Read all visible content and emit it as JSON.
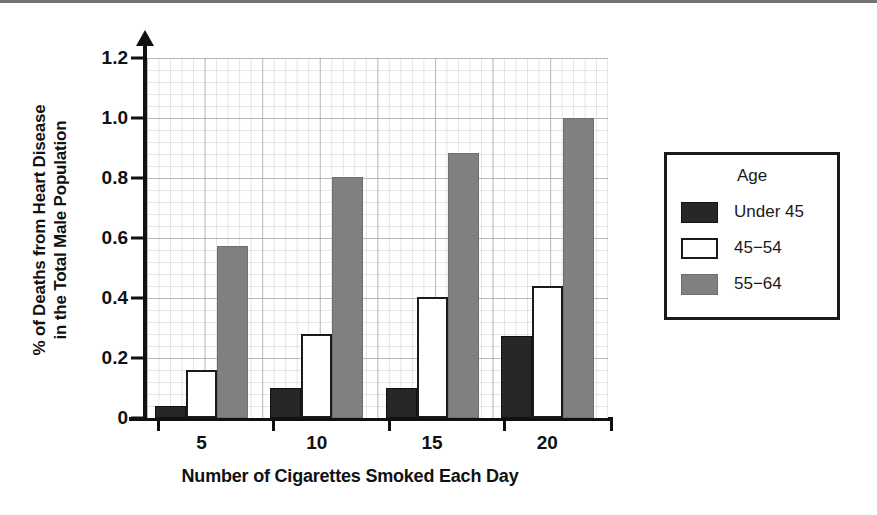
{
  "chart_data": {
    "type": "bar",
    "title": "",
    "xlabel": "Number of Cigarettes Smoked Each Day",
    "ylabel_line1": "% of Deaths from Heart Disease",
    "ylabel_line2": "in the Total Male Population",
    "categories": [
      "5",
      "10",
      "15",
      "20"
    ],
    "series": [
      {
        "name": "Under 45",
        "color": "#272727",
        "values": [
          0.04,
          0.1,
          0.1,
          0.275
        ]
      },
      {
        "name": "45−54",
        "color": "#ffffff",
        "values": [
          0.16,
          0.28,
          0.405,
          0.44
        ]
      },
      {
        "name": "55−64",
        "color": "#808080",
        "values": [
          0.575,
          0.805,
          0.885,
          1.0
        ]
      }
    ],
    "ylim": [
      0,
      1.2
    ],
    "yticks": [
      0,
      0.2,
      0.4,
      0.6,
      0.8,
      1.0,
      1.2
    ],
    "ytick_labels": [
      "0",
      "0.2",
      "0.4",
      "0.6",
      "0.8",
      "1.0",
      "1.2"
    ],
    "grid": true,
    "legend_position": "right"
  },
  "legend": {
    "title": "Age",
    "entries": [
      {
        "label": "Under 45",
        "swatch": "c0"
      },
      {
        "label": "45−54",
        "swatch": "c1"
      },
      {
        "label": "55−64",
        "swatch": "c2"
      }
    ]
  }
}
